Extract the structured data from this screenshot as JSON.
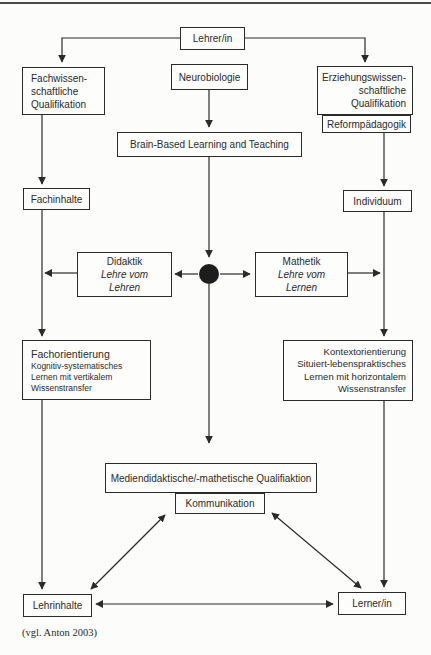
{
  "ink_color": "#2b2b2b",
  "diagram": {
    "nodes": {
      "lehrer_in": "Lehrer/in",
      "fachwissen": [
        "Fachwissen-",
        "schaftliche",
        "Qualifikation"
      ],
      "neurobiologie": "Neurobiologie",
      "erziehung": [
        "Erziehungswissen-",
        "schaftliche",
        "Qualifikation"
      ],
      "reformpaedagogik": "Reformpädagogik",
      "brain_based": "Brain-Based Learning and Teaching",
      "fachinhalte": "Fachinhalte",
      "individuum": "Individuum",
      "didaktik": {
        "title": "Didaktik",
        "sub": [
          "Lehre vom",
          "Lehren"
        ]
      },
      "mathetik": {
        "title": "Mathetik",
        "sub": [
          "Lehre vom",
          "Lernen"
        ]
      },
      "fachorientierung": {
        "title": "Fachorientierung",
        "lines": [
          "Kognitiv-systematisches",
          "Lernen mit vertikalem",
          "Wissenstransfer"
        ]
      },
      "kontextorientierung": {
        "title": "Kontextorientierung",
        "lines": [
          "Situiert-lebenspraktisches",
          "Lernen mit horizontalem",
          "Wissenstransfer"
        ]
      },
      "mediendidaktik": "Mediendidaktische/-mathetische Qualifiaktion",
      "kommunikation": "Kommunikation",
      "lehrinhalte": "Lehrinhalte",
      "lerner_in": "Lerner/in"
    },
    "caption": "(vgl. Anton 2003)"
  }
}
